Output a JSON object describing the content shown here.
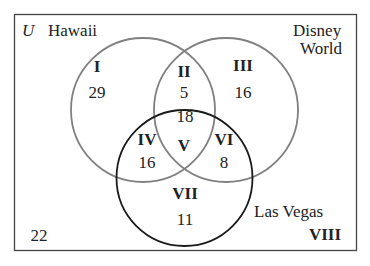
{
  "diagram": {
    "type": "venn",
    "universe_label": "U",
    "sets": [
      {
        "name": "Hawaii",
        "stroke": "#808080"
      },
      {
        "name": "Disney World",
        "line1": "Disney",
        "line2": "World",
        "stroke": "#808080"
      },
      {
        "name": "Las Vegas",
        "stroke": "#1a1a1a"
      }
    ],
    "regions": [
      {
        "roman": "I",
        "value": "29"
      },
      {
        "roman": "II",
        "value": "5"
      },
      {
        "roman": "III",
        "value": "16"
      },
      {
        "roman": "IV",
        "value": "16"
      },
      {
        "roman": "V",
        "value": "18"
      },
      {
        "roman": "VI",
        "value": "8"
      },
      {
        "roman": "VII",
        "value": "11"
      },
      {
        "roman": "VIII",
        "value": "22"
      }
    ],
    "frame_color": "#444444"
  }
}
